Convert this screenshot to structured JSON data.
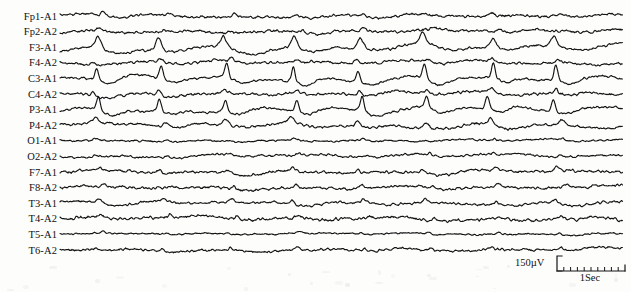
{
  "figure": {
    "type": "eeg-recording",
    "modality": "Electroencephalogram",
    "montage": "referential (ear reference A1/A2)",
    "channel_count": 16,
    "background_color": "#fdfdfc",
    "trace_color": "#141414"
  },
  "layout": {
    "width": 631,
    "height": 292,
    "label_right_edge": 57,
    "trace_start_x": 60,
    "trace_end_x": 623,
    "first_trace_y": 15.5,
    "trace_spacing": 15.6
  },
  "channels": [
    {
      "label": "Fp1-A1",
      "index": 0,
      "baseline_y": 15.5,
      "noise": 1.5,
      "slow": 1.4,
      "spike_amp": 3.0,
      "spike_dir": -1,
      "spike_width": 7,
      "phase": 0.35,
      "drift": 0.8
    },
    {
      "label": "Fp2-A2",
      "index": 1,
      "baseline_y": 31.1,
      "noise": 1.6,
      "slow": 1.5,
      "spike_amp": 2.4,
      "spike_dir": -1,
      "spike_width": 7,
      "phase": 0.55,
      "drift": 0.7
    },
    {
      "label": "F3-A1",
      "index": 2,
      "baseline_y": 46.7,
      "noise": 1.4,
      "slow": 3.2,
      "spike_amp": 11.0,
      "spike_dir": -1,
      "spike_width": 10,
      "phase": 0.0,
      "drift": 1.6
    },
    {
      "label": "F4-A2",
      "index": 3,
      "baseline_y": 62.3,
      "noise": 1.5,
      "slow": 1.8,
      "spike_amp": 3.2,
      "spike_dir": -1,
      "spike_width": 7,
      "phase": 0.1,
      "drift": 0.9
    },
    {
      "label": "C3-A1",
      "index": 4,
      "baseline_y": 77.9,
      "noise": 1.3,
      "slow": 2.6,
      "spike_amp": 13.5,
      "spike_dir": -1,
      "spike_width": 6,
      "phase": 0.02,
      "drift": 1.4
    },
    {
      "label": "C4-A2",
      "index": 5,
      "baseline_y": 93.5,
      "noise": 1.6,
      "slow": 1.7,
      "spike_amp": 4.0,
      "spike_dir": -1,
      "spike_width": 6,
      "phase": 0.05,
      "drift": 0.9
    },
    {
      "label": "P3-A1",
      "index": 6,
      "baseline_y": 109.1,
      "noise": 1.3,
      "slow": 2.4,
      "spike_amp": 12.5,
      "spike_dir": -1,
      "spike_width": 6,
      "phase": 0.04,
      "drift": 1.3
    },
    {
      "label": "P4-A2",
      "index": 7,
      "baseline_y": 124.7,
      "noise": 1.5,
      "slow": 2.6,
      "spike_amp": 5.5,
      "spike_dir": -1,
      "spike_width": 8,
      "phase": 0.08,
      "drift": 1.1
    },
    {
      "label": "O1-A1",
      "index": 8,
      "baseline_y": 140.3,
      "noise": 1.1,
      "slow": 0.9,
      "spike_amp": 1.4,
      "spike_dir": -1,
      "spike_width": 6,
      "phase": 0.3,
      "drift": 0.5
    },
    {
      "label": "O2-A2",
      "index": 9,
      "baseline_y": 155.9,
      "noise": 1.3,
      "slow": 1.6,
      "spike_amp": 2.0,
      "spike_dir": -1,
      "spike_width": 5,
      "phase": 0.42,
      "drift": 0.8
    },
    {
      "label": "F7-A1",
      "index": 10,
      "baseline_y": 171.5,
      "noise": 1.5,
      "slow": 1.9,
      "spike_amp": 3.4,
      "spike_dir": -1,
      "spike_width": 8,
      "phase": 0.18,
      "drift": 0.9
    },
    {
      "label": "F8-A2",
      "index": 11,
      "baseline_y": 187.1,
      "noise": 1.6,
      "slow": 1.6,
      "spike_amp": 2.6,
      "spike_dir": -1,
      "spike_width": 7,
      "phase": 0.62,
      "drift": 0.8
    },
    {
      "label": "T3-A1",
      "index": 12,
      "baseline_y": 202.7,
      "noise": 1.4,
      "slow": 1.7,
      "spike_amp": 3.6,
      "spike_dir": -1,
      "spike_width": 8,
      "phase": 0.12,
      "drift": 0.8
    },
    {
      "label": "T4-A2",
      "index": 13,
      "baseline_y": 218.3,
      "noise": 1.8,
      "slow": 1.9,
      "spike_amp": 2.6,
      "spike_dir": -1,
      "spike_width": 6,
      "phase": 0.7,
      "drift": 0.9
    },
    {
      "label": "T5-A1",
      "index": 14,
      "baseline_y": 233.9,
      "noise": 0.9,
      "slow": 0.8,
      "spike_amp": 1.6,
      "spike_dir": -1,
      "spike_width": 5,
      "phase": 0.48,
      "drift": 0.4
    },
    {
      "label": "T6-A2",
      "index": 15,
      "baseline_y": 249.5,
      "noise": 1.4,
      "slow": 1.5,
      "spike_amp": 2.6,
      "spike_dir": -1,
      "spike_width": 5,
      "phase": 0.52,
      "drift": 0.8
    }
  ],
  "discharges": {
    "description": "periodic generalized sharp-wave / spike-and-slow-wave discharges",
    "period_px": 66,
    "first_x": 95,
    "count": 8
  },
  "calibration": {
    "amplitude_label": "150µV",
    "time_label": "1Sec",
    "amplitude_value": 150,
    "amplitude_units": "µV",
    "time_value": 1,
    "time_units": "Sec",
    "vertical_bar_height": 15,
    "horizontal_bar_width": 66,
    "tick_count": 10
  },
  "chart_data": {
    "type": "line",
    "title": "",
    "xlabel": "1Sec",
    "ylabel": "150µV",
    "grid": false,
    "legend": "none",
    "series": [
      {
        "name": "Fp1-A1"
      },
      {
        "name": "Fp2-A2"
      },
      {
        "name": "F3-A1"
      },
      {
        "name": "F4-A2"
      },
      {
        "name": "C3-A1"
      },
      {
        "name": "C4-A2"
      },
      {
        "name": "P3-A1"
      },
      {
        "name": "P4-A2"
      },
      {
        "name": "O1-A1"
      },
      {
        "name": "O2-A2"
      },
      {
        "name": "F7-A1"
      },
      {
        "name": "F8-A2"
      },
      {
        "name": "T3-A1"
      },
      {
        "name": "T4-A2"
      },
      {
        "name": "T5-A1"
      },
      {
        "name": "T6-A2"
      }
    ]
  }
}
